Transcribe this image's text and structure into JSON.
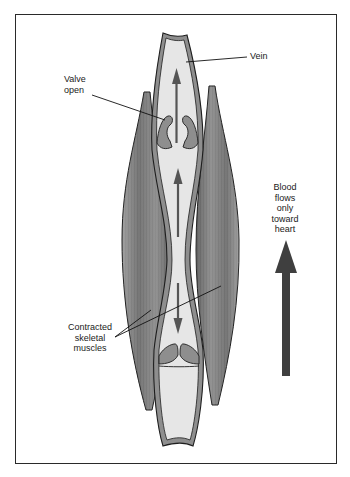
{
  "figure": {
    "type": "anatomical-diagram",
    "labels": {
      "vein": "Vein",
      "valve": [
        "Valve",
        "open"
      ],
      "muscles": [
        "Contracted",
        "skeletal",
        "muscles"
      ],
      "flow": [
        "Blood",
        "flows",
        "only",
        "toward",
        "heart"
      ]
    },
    "colors": {
      "frame": "#2a2a2a",
      "vein_wall": "#8e8e8e",
      "vein_lumen": "#e6e6e6",
      "muscle": "#7a7a7a",
      "arrow": "#555555",
      "big_arrow": "#3f3f3f",
      "outline": "#1e1e1e"
    },
    "arrows": {
      "in_vein": [
        {
          "direction": "up",
          "position": "upper segment"
        },
        {
          "direction": "up",
          "position": "middle segment"
        },
        {
          "direction": "down",
          "position": "lower segment"
        }
      ],
      "main": {
        "direction": "up",
        "meaning": "toward heart"
      }
    }
  }
}
